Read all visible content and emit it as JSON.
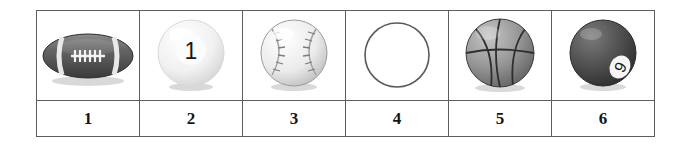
{
  "page": {
    "background_color": "#ffffff"
  },
  "table": {
    "border_color": "#5d5d5d",
    "column_count": 6,
    "row_count": 2,
    "cells": [
      {
        "number_label": "1",
        "icon_name": "american-football-icon",
        "item": "American football",
        "description": "Dark gray American football with white stripes and white laces",
        "colors": {
          "body": "#5a5a5a",
          "stripe": "#f2f2f2",
          "laces": "#ffffff"
        }
      },
      {
        "number_label": "2",
        "icon_name": "billiard-ball-one-icon",
        "item": "White billiard ball number 1",
        "description": "Glossy white cue-style billiard ball with a black numeral 1",
        "ball_number": "1",
        "colors": {
          "body": "#f4f4f4",
          "numeral": "#1b1b1b"
        }
      },
      {
        "number_label": "3",
        "icon_name": "baseball-icon",
        "item": "Baseball",
        "description": "White baseball with two curved rows of stitching",
        "colors": {
          "body": "#ededed",
          "stitching": "#8d8d8d"
        }
      },
      {
        "number_label": "4",
        "icon_name": "blank-circle-icon",
        "item": "Empty circle outline",
        "description": "Plain unfilled circle outline, no ball drawn",
        "colors": {
          "outline": "#5a5a5a",
          "fill": "#ffffff"
        }
      },
      {
        "number_label": "5",
        "icon_name": "basketball-icon",
        "item": "Basketball",
        "description": "Gray basketball with curved seam lines",
        "colors": {
          "body": "#949494",
          "seams": "#2e2e2e"
        }
      },
      {
        "number_label": "6",
        "icon_name": "billiard-ball-nine-icon",
        "item": "Dark billiard ball number 9",
        "description": "Dark gray billiard ball with a white circle badge showing a numeral",
        "ball_number": "9",
        "colors": {
          "body": "#4a4a4a",
          "badge": "#f5f5f5",
          "numeral": "#1b1b1b"
        }
      }
    ]
  }
}
